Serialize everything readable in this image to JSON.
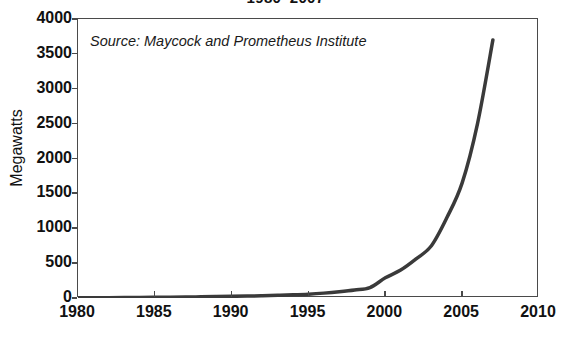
{
  "chart_data": {
    "type": "line",
    "title": "1980–2007",
    "xlabel": "",
    "ylabel": "Megawatts",
    "xlim": [
      1980,
      2010
    ],
    "ylim": [
      0,
      4000
    ],
    "grid": false,
    "legend": null,
    "annotations": [
      {
        "name": "source-note",
        "text": "Source: Maycock and Prometheus Institute",
        "style": "italic"
      }
    ],
    "x_ticks": [
      1980,
      1985,
      1990,
      1995,
      2000,
      2005,
      2010
    ],
    "x_tick_labels": [
      "1980",
      "1985",
      "1990",
      "1995",
      "2000",
      "2005",
      "2010"
    ],
    "y_ticks": [
      0,
      500,
      1000,
      1500,
      2000,
      2500,
      3000,
      3500,
      4000
    ],
    "y_tick_labels": [
      "0",
      "500",
      "1000",
      "1500",
      "2000",
      "2500",
      "3000",
      "3500",
      "4000"
    ],
    "series": [
      {
        "name": "Solar photovoltaic production",
        "color": "#3a3a3a",
        "line_width": 3.5,
        "x": [
          1980,
          1981,
          1982,
          1983,
          1984,
          1985,
          1986,
          1987,
          1988,
          1989,
          1990,
          1991,
          1992,
          1993,
          1994,
          1995,
          1996,
          1997,
          1998,
          1999,
          2000,
          2001,
          2002,
          2003,
          2004,
          2005,
          2006,
          2007
        ],
        "values": [
          2,
          3,
          4,
          6,
          8,
          10,
          12,
          14,
          17,
          20,
          24,
          28,
          32,
          38,
          45,
          55,
          70,
          90,
          115,
          150,
          290,
          400,
          560,
          750,
          1150,
          1650,
          2500,
          3700
        ]
      }
    ]
  },
  "axes": {
    "y_title": "Megawatts"
  },
  "colors": {
    "line": "#3a3a3a",
    "frame": "#4a4a4a",
    "text": "#111111",
    "background": "#ffffff"
  }
}
